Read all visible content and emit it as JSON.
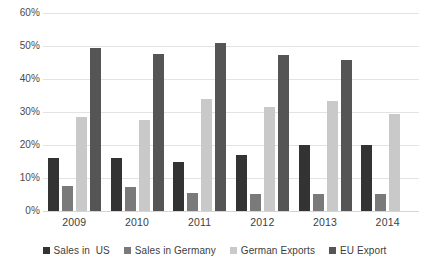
{
  "chart_data": {
    "type": "bar",
    "title": "",
    "subtitle": "",
    "xlabel": "",
    "ylabel": "",
    "categories": [
      "2009",
      "2010",
      "2011",
      "2012",
      "2013",
      "2014"
    ],
    "ylim": [
      0,
      60
    ],
    "y_tick_labels": [
      "60%",
      "50%",
      "40%",
      "30%",
      "20%",
      "10%",
      "0%"
    ],
    "y_tick_values": [
      60,
      50,
      40,
      30,
      20,
      10,
      0
    ],
    "y_unit": "%",
    "grid": true,
    "legend_position": "bottom",
    "series": [
      {
        "name": "Sales in  US",
        "color": "#333333",
        "values": [
          16.0,
          16.0,
          15.0,
          17.0,
          20.0,
          20.0
        ]
      },
      {
        "name": "Sales in Germany",
        "color": "#7a7a7a",
        "values": [
          7.7,
          7.2,
          5.5,
          5.2,
          5.3,
          5.1
        ]
      },
      {
        "name": "German Exports",
        "color": "#c9c9c9",
        "values": [
          28.5,
          27.5,
          33.8,
          31.5,
          33.2,
          29.5
        ]
      },
      {
        "name": "EU Export",
        "color": "#555555",
        "values": [
          49.3,
          47.7,
          50.8,
          47.3,
          45.7,
          null
        ]
      }
    ]
  },
  "legend": {
    "items": [
      {
        "label": "Sales in  US",
        "color": "#333333"
      },
      {
        "label": "Sales in Germany",
        "color": "#7a7a7a"
      },
      {
        "label": "German Exports",
        "color": "#c9c9c9"
      },
      {
        "label": "EU Export",
        "color": "#555555"
      }
    ]
  }
}
